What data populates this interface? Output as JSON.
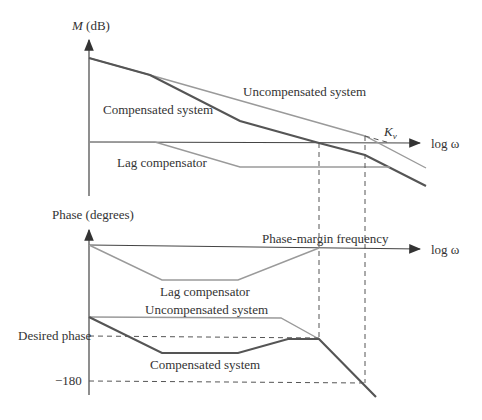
{
  "figure": {
    "magnitude": {
      "y_axis_label_italic": "M",
      "y_axis_label_rest": " (dB)",
      "x_axis_label": "log ω",
      "labels": {
        "uncompensated": "Uncompensated system",
        "compensated": "Compensated system",
        "lag": "Lag compensator",
        "kv_main": "K",
        "kv_sub": "v"
      }
    },
    "phase": {
      "y_axis_label": "Phase (degrees)",
      "x_axis_label": "log ω",
      "labels": {
        "pm_freq": "Phase-margin frequency",
        "lag": "Lag compensator",
        "uncompensated": "Uncompensated system",
        "compensated": "Compensated system",
        "desired": "Desired phase",
        "minus180": "−180"
      }
    },
    "colors": {
      "axis": "#444444",
      "compensated": "#555555",
      "uncompensated": "#9a9a9a",
      "lag": "#9a9a9a"
    }
  }
}
